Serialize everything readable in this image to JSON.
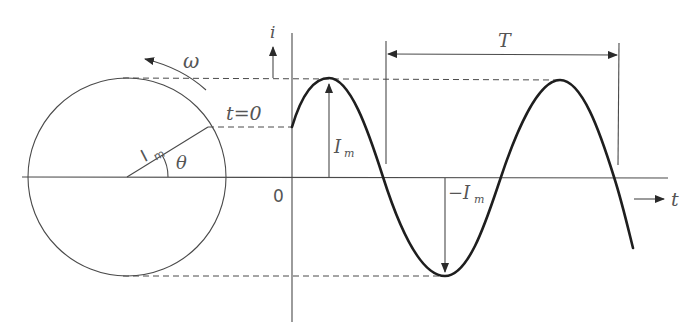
{
  "diagram": {
    "labels": {
      "omega": "ω",
      "i_axis": "i",
      "t_axis": "t",
      "t_zero": "t=0",
      "origin": "0",
      "im_phasor": "I",
      "im_phasor_sub": "m",
      "theta": "θ",
      "im_peak": "I",
      "im_peak_sub": "m",
      "neg_im": "−I",
      "neg_im_sub": "m",
      "period": "T"
    },
    "colors": {
      "line": "#4a4a4a",
      "curve": "#1e1e1e",
      "text": "#555555",
      "background": "#ffffff"
    }
  }
}
